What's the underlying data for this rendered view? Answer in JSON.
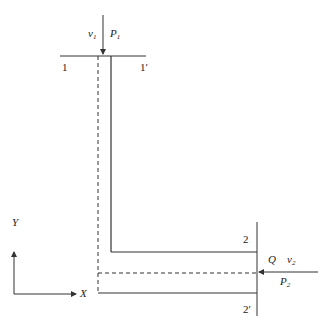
{
  "diagram": {
    "labels": {
      "v1": "v",
      "v1_sub": "1",
      "p1": "P",
      "p1_sub": "1",
      "sec1_left": "1",
      "sec1_right": "1′",
      "sec2_top": "2",
      "sec2_bottom": "2′",
      "q": "Q",
      "v2": "v",
      "v2_sub": "2",
      "p2": "P",
      "p2_sub": "2",
      "axis_x": "X",
      "axis_y": "Y"
    },
    "colors": {
      "line": "#333333",
      "background": "#ffffff"
    }
  }
}
